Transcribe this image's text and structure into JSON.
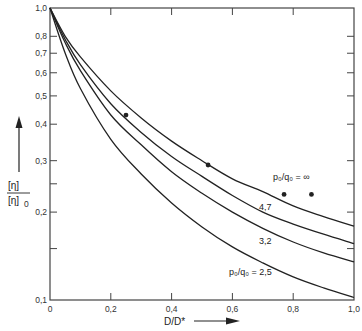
{
  "chart_data": {
    "type": "line",
    "title": "",
    "xlabel": "D/D*",
    "ylabel": "[η]/[η]₀",
    "ylabel_numerator": "[η]",
    "ylabel_denominator": "[η]",
    "ylabel_denominator_sub": "0",
    "xlim": [
      0,
      1.0
    ],
    "ylim": [
      0.1,
      1.0
    ],
    "yscale": "log",
    "grid": false,
    "legend": "inline curve labels",
    "x_ticks": [
      0,
      0.2,
      0.4,
      0.6,
      0.8,
      1.0
    ],
    "x_tick_labels": [
      "0",
      "0,2",
      "0,4",
      "0,6",
      "0,8",
      "1,0"
    ],
    "y_ticks": [
      0.1,
      0.15,
      0.2,
      0.25,
      0.3,
      0.4,
      0.5,
      0.6,
      0.7,
      0.8,
      1.0
    ],
    "y_tick_labels": [
      "0,1",
      "",
      "0,2",
      "",
      "0,3",
      "0,4",
      "0,5",
      "0,6",
      "0,7",
      "0,8",
      "1,0"
    ],
    "x": [
      0,
      0.05,
      0.1,
      0.2,
      0.3,
      0.4,
      0.5,
      0.6,
      0.7,
      0.8,
      0.9,
      1.0
    ],
    "series": [
      {
        "name": "p0/q0 = ∞",
        "label": "p₀/q₀ = ∞",
        "values": [
          1.0,
          0.8,
          0.68,
          0.52,
          0.42,
          0.35,
          0.3,
          0.26,
          0.235,
          0.21,
          0.193,
          0.179
        ]
      },
      {
        "name": "p0/q0 = 4.7",
        "label": "4,7",
        "values": [
          1.0,
          0.78,
          0.64,
          0.47,
          0.375,
          0.31,
          0.265,
          0.228,
          0.2,
          0.182,
          0.168,
          0.156
        ]
      },
      {
        "name": "p0/q0 = 3.2",
        "label": "3,2",
        "values": [
          1.0,
          0.76,
          0.61,
          0.43,
          0.34,
          0.275,
          0.232,
          0.2,
          0.176,
          0.158,
          0.145,
          0.135
        ]
      },
      {
        "name": "p0/q0 = 2.5",
        "label": "p₀/q₀ = 2,5",
        "values": [
          1.0,
          0.7,
          0.53,
          0.355,
          0.27,
          0.215,
          0.178,
          0.152,
          0.134,
          0.12,
          0.11,
          0.102
        ]
      }
    ],
    "scatter_points": [
      {
        "x": 0.25,
        "y": 0.43
      },
      {
        "x": 0.52,
        "y": 0.29
      },
      {
        "x": 0.77,
        "y": 0.23
      },
      {
        "x": 0.86,
        "y": 0.23
      }
    ],
    "annotations": [
      "p₀/q₀ = ∞",
      "4,7",
      "3,2",
      "p₀/q₀ = 2,5"
    ]
  },
  "labels": {
    "curve_inf": "p₀/q₀ = ∞",
    "curve_47": "4,7",
    "curve_32": "3,2",
    "curve_25": "p₀/q₀ = 2,5",
    "xlabel": "D/D*",
    "y_num": "[η]",
    "y_den": "[η]",
    "y_den_sub": "0"
  },
  "colors": {
    "line": "#222222",
    "axis": "#444444",
    "background": "#ffffff"
  }
}
